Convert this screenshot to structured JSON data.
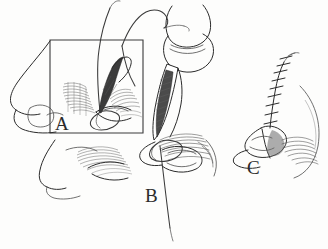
{
  "figure": {
    "style": "pen-and-ink line drawing with cross-hatch shading",
    "background_color": "#fdfdfc",
    "ink_color": "#2b2b2b",
    "panels": [
      {
        "id": "A",
        "label": "A",
        "label_position": {
          "x": 55,
          "y": 114
        },
        "caption": "Inset boxed view: lateral nasal profile with needle passing through medial canthal tissue, suture loop placed",
        "has_frame": true,
        "frame": {
          "x": 50,
          "y": 40,
          "width": 93,
          "height": 93
        },
        "elements": [
          "nose-profile",
          "needle-in-tissue",
          "suture-loop",
          "cross-hatch-shading",
          "eyelid-margin"
        ]
      },
      {
        "id": "B",
        "label": "B",
        "label_position": {
          "x": 145,
          "y": 186
        },
        "caption": "Magnified view: needle holder grasping curved needle, suture thread drawn down through the wound",
        "has_frame": false,
        "elements": [
          "needle-holder-instrument",
          "instrument-jaws",
          "curved-needle",
          "suture-thread-long-tail",
          "eye-and-lashes",
          "medial-canthus"
        ]
      },
      {
        "id": "C",
        "label": "C",
        "label_position": {
          "x": 247,
          "y": 158
        },
        "caption": "Final result: closed wound with vertical running line of interrupted sutures above the medial canthus",
        "has_frame": false,
        "stitch_count": 9,
        "elements": [
          "closed-incision",
          "interrupted-sutures",
          "medial-canthal-fold",
          "eye-and-lashes",
          "brow-contour"
        ]
      }
    ],
    "anatomy_labels": [],
    "annotations": []
  }
}
